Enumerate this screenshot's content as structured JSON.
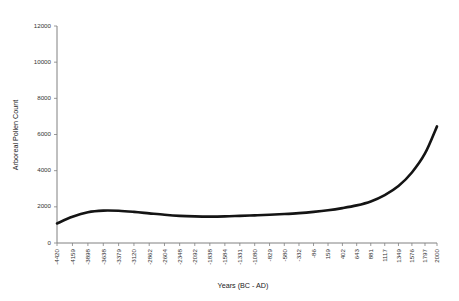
{
  "chart_data": {
    "type": "line",
    "title": "",
    "xlabel": "Years (BC - AD)",
    "ylabel": "Arboreal Pollen Count",
    "ylim": [
      0,
      12000
    ],
    "ytick_labels": [
      "0",
      "2000",
      "4000",
      "6000",
      "8000",
      "10000",
      "12000"
    ],
    "ytick_values": [
      0,
      2000,
      4000,
      6000,
      8000,
      10000,
      12000
    ],
    "grid": false,
    "legend": "none",
    "xlim": [
      -4420,
      2000
    ],
    "categories": [
      "-4420",
      "-4159",
      "-3898",
      "-3638",
      "-3379",
      "-3120",
      "-2862",
      "-2604",
      "-2348",
      "-2092",
      "-1838",
      "-1584",
      "-1331",
      "-1080",
      "-829",
      "-580",
      "-332",
      "-86",
      "159",
      "402",
      "643",
      "881",
      "1117",
      "1349",
      "1576",
      "1797",
      "2000"
    ],
    "x": [
      -4420,
      -4159,
      -3898,
      -3638,
      -3379,
      -3120,
      -2862,
      -2604,
      -2348,
      -2092,
      -1838,
      -1584,
      -1331,
      -1080,
      -829,
      -580,
      -332,
      -86,
      159,
      402,
      643,
      881,
      1117,
      1349,
      1576,
      1797,
      2000
    ],
    "series": [
      {
        "name": "Arboreal Pollen Count",
        "values": [
          1080,
          1450,
          1700,
          1790,
          1780,
          1720,
          1640,
          1560,
          1500,
          1470,
          1460,
          1470,
          1500,
          1530,
          1560,
          1600,
          1650,
          1720,
          1810,
          1930,
          2080,
          2300,
          2650,
          3150,
          3900,
          4950,
          6450
        ]
      }
    ]
  }
}
